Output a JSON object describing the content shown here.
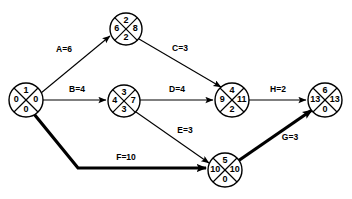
{
  "diagram": {
    "type": "cpm-network",
    "colors": {
      "background": "#ffffff",
      "stroke": "#000000",
      "critical": "#000000"
    },
    "nodes": [
      {
        "id": "n1",
        "event": "1",
        "top": "1",
        "left": "0",
        "right": "0",
        "bottom": "0",
        "cx": 26,
        "cy": 100,
        "r": 17
      },
      {
        "id": "n2",
        "event": "2",
        "top": "2",
        "left": "6",
        "right": "8",
        "bottom": "2",
        "cx": 126,
        "cy": 29,
        "r": 16
      },
      {
        "id": "n3",
        "event": "3",
        "top": "3",
        "left": "4",
        "right": "7",
        "bottom": "3",
        "cx": 124,
        "cy": 101,
        "r": 16
      },
      {
        "id": "n4",
        "event": "4",
        "top": "4",
        "left": "9",
        "right": "11",
        "bottom": "2",
        "cx": 232,
        "cy": 100,
        "r": 17
      },
      {
        "id": "n5",
        "event": "5",
        "top": "5",
        "left": "10",
        "right": "10",
        "bottom": "0",
        "cx": 225,
        "cy": 170,
        "r": 17
      },
      {
        "id": "n6",
        "event": "6",
        "top": "6",
        "left": "13",
        "right": "13",
        "bottom": "0",
        "cx": 325,
        "cy": 100,
        "r": 17
      }
    ],
    "edges": [
      {
        "id": "eA",
        "label": "A=6",
        "activity": "A",
        "duration": "6",
        "from": "n1",
        "to": "n2",
        "critical": false,
        "path": "M 41 93 L 110 36",
        "label_x": 64,
        "label_y": 50
      },
      {
        "id": "eB",
        "label": "B=4",
        "activity": "B",
        "duration": "4",
        "from": "n1",
        "to": "n3",
        "critical": false,
        "path": "M 43 100 L 106 100",
        "label_x": 77,
        "label_y": 90
      },
      {
        "id": "eC",
        "label": "C=3",
        "activity": "C",
        "duration": "3",
        "from": "n2",
        "to": "n4",
        "critical": false,
        "path": "M 139 39 L 221 87",
        "label_x": 180,
        "label_y": 49
      },
      {
        "id": "eD",
        "label": "D=4",
        "activity": "D",
        "duration": "4",
        "from": "n3",
        "to": "n4",
        "critical": false,
        "path": "M 140 100 L 213 100",
        "label_x": 177,
        "label_y": 90
      },
      {
        "id": "eE",
        "label": "E=3",
        "activity": "E",
        "duration": "3",
        "from": "n3",
        "to": "n5",
        "critical": false,
        "path": "M 136 112 L 209 163",
        "label_x": 185,
        "label_y": 131
      },
      {
        "id": "eF",
        "label": "F=10",
        "activity": "F",
        "duration": "10",
        "from": "n1",
        "to": "n5",
        "critical": true,
        "path": "M 34 114 L 78 168 L 206 168",
        "label_x": 126,
        "label_y": 158
      },
      {
        "id": "eG",
        "label": "G=3",
        "activity": "G",
        "duration": "3",
        "from": "n5",
        "to": "n6",
        "critical": true,
        "path": "M 238 161 L 312 110",
        "label_x": 290,
        "label_y": 138
      },
      {
        "id": "eH",
        "label": "H=2",
        "activity": "H",
        "duration": "2",
        "from": "n4",
        "to": "n6",
        "critical": false,
        "path": "M 249 100 L 306 100",
        "label_x": 278,
        "label_y": 90
      }
    ]
  }
}
